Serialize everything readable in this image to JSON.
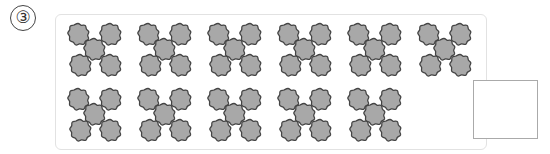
{
  "problem": {
    "number_label": "③",
    "flower_color": "#a8a8a8",
    "flower_outline": "#444444",
    "groups_per_row": [
      6,
      5
    ],
    "flowers_per_group": 5,
    "total_groups": 11,
    "answer_value": ""
  }
}
